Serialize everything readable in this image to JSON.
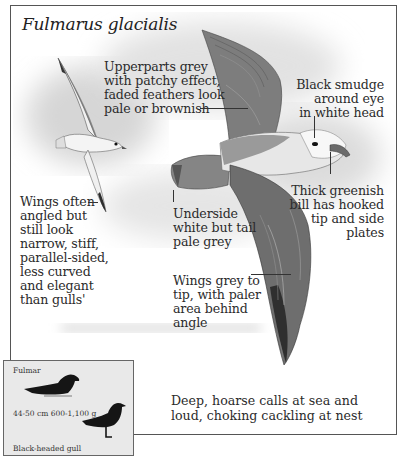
{
  "species": {
    "scientific_name": "Fulmarus glacialis"
  },
  "annotations": {
    "upperparts": [
      "Upperparts grey",
      "with patchy effect,",
      "faded feathers look",
      "pale or brownish"
    ],
    "eye": [
      "Black smudge",
      "around eye",
      "in white head"
    ],
    "bill": [
      "Thick greenish",
      "bill has hooked",
      "tip and side",
      "plates"
    ],
    "wings_shape": [
      "Wings often",
      "angled but",
      "still look",
      "narrow, stiff,",
      "parallel-sided,",
      "less curved",
      "and elegant",
      "than gulls'"
    ],
    "underside": [
      "Underside",
      "white but tail",
      "pale grey"
    ],
    "wings_colour": [
      "Wings grey to",
      "tip, with paler",
      "area behind",
      "angle"
    ],
    "calls": [
      "Deep, hoarse calls at sea and",
      "loud, choking cackling at nest"
    ]
  },
  "size_comparison": {
    "species_label": "Fulmar",
    "measurements": "44-50 cm  600-1,100 g",
    "reference_label": "Black-headed gull"
  },
  "colors": {
    "frame": "#555555",
    "inset_background": "#e9e9e9",
    "text": "#2b2b2b",
    "wash": "#d4d4d4"
  }
}
